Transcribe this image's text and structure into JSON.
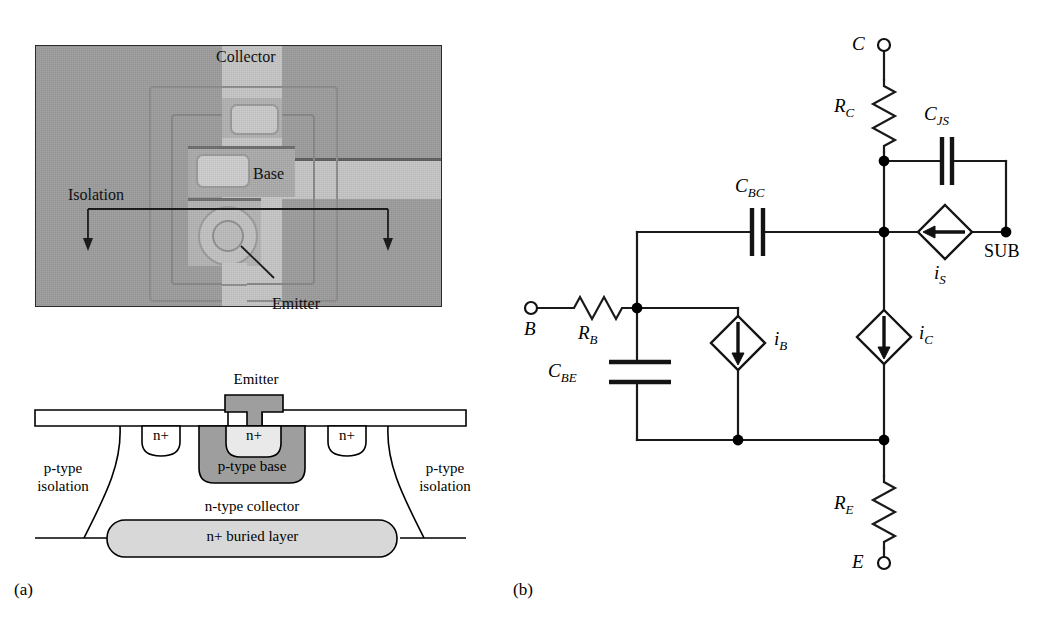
{
  "figure": {
    "panel_a_caption": "(a)",
    "panel_b_caption": "(b)"
  },
  "micrograph": {
    "labels": {
      "collector": "Collector",
      "base": "Base",
      "emitter": "Emitter",
      "isolation": "Isolation"
    },
    "colors": {
      "background": "#9d9d9d",
      "field": "#a0a0a0",
      "light_stripe": "#c9c9c9",
      "contact": "#b9b9b9",
      "border": "#2a2a2a"
    }
  },
  "cross_section": {
    "labels": {
      "emitter": "Emitter",
      "n_plus_left": "n+",
      "n_plus_center": "n+",
      "n_plus_right": "n+",
      "p_type_base": "p-type base",
      "p_type_isolation_left_line1": "p-type",
      "p_type_isolation_left_line2": "isolation",
      "p_type_isolation_right_line1": "p-type",
      "p_type_isolation_right_line2": "isolation",
      "n_type_collector": "n-type collector",
      "n_plus_buried_layer": "n+ buried layer"
    },
    "colors": {
      "base_fill": "#9e9e9e",
      "buried_fill": "#d6d6d6",
      "contact_fill": "#9e9e9e",
      "outline": "#000000",
      "oxide_fill": "#ffffff"
    }
  },
  "circuit": {
    "terminals": [
      {
        "id": "collector",
        "label": "C"
      },
      {
        "id": "base",
        "label": "B"
      },
      {
        "id": "emitter",
        "label": "E"
      },
      {
        "id": "substrate",
        "label": "SUB"
      }
    ],
    "resistors": [
      {
        "id": "rc",
        "label": "R",
        "sub": "C"
      },
      {
        "id": "rb",
        "label": "R",
        "sub": "B"
      },
      {
        "id": "re",
        "label": "R",
        "sub": "E"
      }
    ],
    "capacitors": [
      {
        "id": "cjs",
        "label": "C",
        "sub": "JS"
      },
      {
        "id": "cbc",
        "label": "C",
        "sub": "BC"
      },
      {
        "id": "cbe",
        "label": "C",
        "sub": "BE"
      }
    ],
    "sources": [
      {
        "id": "is",
        "label": "i",
        "sub": "S",
        "direction": "left"
      },
      {
        "id": "ic",
        "label": "i",
        "sub": "C",
        "direction": "down"
      },
      {
        "id": "ib",
        "label": "i",
        "sub": "B",
        "direction": "down"
      }
    ],
    "colors": {
      "wire": "#1a1a1a",
      "node": "#000000"
    }
  }
}
